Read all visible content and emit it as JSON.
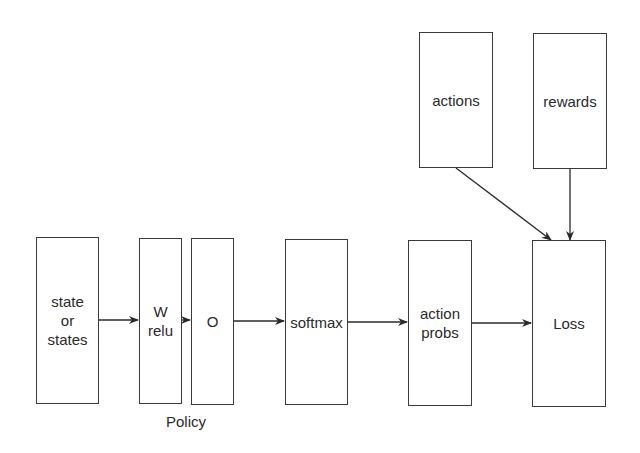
{
  "diagram": {
    "nodes": {
      "state": {
        "label": "state\nor\nstates"
      },
      "w_relu": {
        "label": "W\nrelu"
      },
      "o": {
        "label": "O"
      },
      "softmax": {
        "label": "softmax"
      },
      "action_probs": {
        "label": "action\nprobs"
      },
      "loss": {
        "label": "Loss"
      },
      "actions": {
        "label": "actions"
      },
      "rewards": {
        "label": "rewards"
      }
    },
    "group_label": "Policy",
    "edges": [
      {
        "from": "state",
        "to": "w_relu"
      },
      {
        "from": "w_relu",
        "to": "o"
      },
      {
        "from": "o",
        "to": "softmax"
      },
      {
        "from": "softmax",
        "to": "action_probs"
      },
      {
        "from": "action_probs",
        "to": "loss"
      },
      {
        "from": "actions",
        "to": "loss"
      },
      {
        "from": "rewards",
        "to": "loss"
      }
    ]
  }
}
